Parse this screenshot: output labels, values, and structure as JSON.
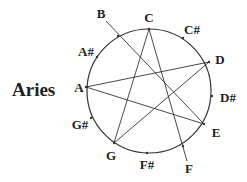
{
  "title": "Aries",
  "colors": {
    "stroke": "#333333",
    "text": "#222222",
    "background": "#ffffff"
  },
  "circle": {
    "cx": 149,
    "cy": 91,
    "r": 62
  },
  "notes": [
    {
      "name": "C",
      "label": "C",
      "lx": 149,
      "ly": 22,
      "px": 149,
      "py": 29
    },
    {
      "name": "C#",
      "label": "C#",
      "lx": 192,
      "ly": 34,
      "px": 183,
      "py": 38
    },
    {
      "name": "D",
      "label": "D",
      "lx": 220,
      "ly": 64,
      "px": 209,
      "py": 62
    },
    {
      "name": "D#",
      "label": "D#",
      "lx": 228,
      "ly": 102,
      "px": 212,
      "py": 96
    },
    {
      "name": "E",
      "label": "E",
      "lx": 216,
      "ly": 137,
      "px": 204,
      "py": 124
    },
    {
      "name": "F",
      "label": "F",
      "lx": 189,
      "ly": 173,
      "px": 183,
      "py": 146
    },
    {
      "name": "F#",
      "label": "F#",
      "lx": 147,
      "ly": 169,
      "px": 147,
      "py": 153
    },
    {
      "name": "G",
      "label": "G",
      "lx": 111,
      "ly": 160,
      "px": 114,
      "py": 143
    },
    {
      "name": "G#",
      "label": "G#",
      "lx": 80,
      "ly": 129,
      "px": 91,
      "py": 118
    },
    {
      "name": "A",
      "label": "A",
      "lx": 79,
      "ly": 92,
      "px": 86,
      "py": 87
    },
    {
      "name": "A#",
      "label": "A#",
      "lx": 86,
      "ly": 56,
      "px": 97,
      "py": 57
    },
    {
      "name": "B",
      "label": "B",
      "lx": 101,
      "ly": 18,
      "px": 118,
      "py": 36
    }
  ],
  "lines": [
    {
      "from": "A",
      "to": "D",
      "x1": 86,
      "y1": 87,
      "x2": 209,
      "y2": 62
    },
    {
      "from": "A",
      "to": "E",
      "x1": 86,
      "y1": 87,
      "x2": 204,
      "y2": 124
    },
    {
      "from": "C",
      "to": "G",
      "x1": 149,
      "y1": 29,
      "x2": 114,
      "y2": 143
    },
    {
      "from": "C",
      "to": "F",
      "x1": 149,
      "y1": 29,
      "x2": 187,
      "y2": 161
    },
    {
      "from": "D",
      "to": "G",
      "x1": 209,
      "y1": 62,
      "x2": 114,
      "y2": 143
    },
    {
      "from": "B",
      "to": "E",
      "x1": 106,
      "y1": 21,
      "x2": 204,
      "y2": 124
    }
  ]
}
